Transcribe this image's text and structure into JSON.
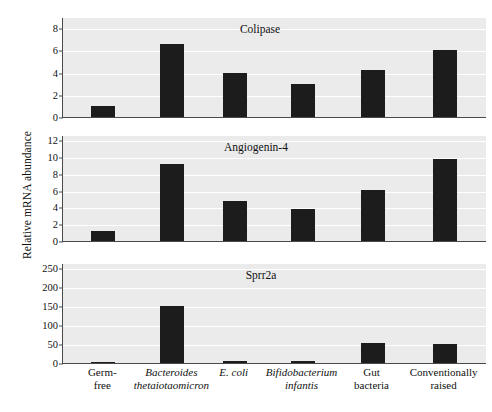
{
  "figure": {
    "ylabel": "Relative mRNA abundance",
    "background_color": "#ffffff",
    "plot_background_color": "#ebebeb",
    "bar_color": "#1c1c1c",
    "gridline_color": "#ffffff",
    "axis_color": "#4a4a4a"
  },
  "categories": [
    {
      "line1": "Germ-",
      "line2": "free",
      "italic1": false,
      "italic2": false
    },
    {
      "line1": "Bacteroides",
      "line2": "thetaiotaomicron",
      "italic1": true,
      "italic2": true
    },
    {
      "line1": "E. coli",
      "line2": "",
      "italic1": true,
      "italic2": false
    },
    {
      "line1": "Bifidobacterium",
      "line2": "infantis",
      "italic1": true,
      "italic2": true
    },
    {
      "line1": "Gut",
      "line2": "bacteria",
      "italic1": false,
      "italic2": false
    },
    {
      "line1": "Conventionally",
      "line2": "raised",
      "italic1": false,
      "italic2": false
    }
  ],
  "chart_data": [
    {
      "type": "bar",
      "title": "Colipase",
      "xlabel": "",
      "ylabel": "Relative mRNA abundance",
      "categories": [
        "Germ-free",
        "Bacteroides thetaiotaomicron",
        "E. coli",
        "Bifidobacterium infantis",
        "Gut bacteria",
        "Conventionally raised"
      ],
      "values": [
        1.0,
        6.6,
        4.0,
        3.0,
        4.25,
        6.0
      ],
      "ylim": [
        0,
        9
      ],
      "yticks": [
        0,
        2,
        4,
        6,
        8
      ],
      "grid": true,
      "legend": "none"
    },
    {
      "type": "bar",
      "title": "Angiogenin-4",
      "xlabel": "",
      "ylabel": "Relative mRNA abundance",
      "categories": [
        "Germ-free",
        "Bacteroides thetaiotaomicron",
        "E. coli",
        "Bifidobacterium infantis",
        "Gut bacteria",
        "Conventionally raised"
      ],
      "values": [
        1.2,
        9.2,
        4.8,
        3.8,
        6.1,
        9.8
      ],
      "ylim": [
        0,
        12.6
      ],
      "yticks": [
        0,
        2,
        4,
        6,
        8,
        10,
        12
      ],
      "grid": true,
      "legend": "none"
    },
    {
      "type": "bar",
      "title": "Sprr2a",
      "xlabel": "",
      "ylabel": "Relative mRNA abundance",
      "categories": [
        "Germ-free",
        "Bacteroides thetaiotaomicron",
        "E. coli",
        "Bifidobacterium infantis",
        "Gut bacteria",
        "Conventionally raised"
      ],
      "values": [
        2,
        149,
        4,
        6,
        52,
        50
      ],
      "ylim": [
        0,
        262
      ],
      "yticks": [
        0,
        50,
        100,
        150,
        200,
        250
      ],
      "grid": true,
      "legend": "none"
    }
  ]
}
